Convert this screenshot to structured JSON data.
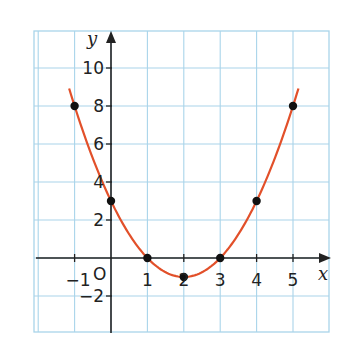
{
  "chart_data": {
    "type": "line",
    "title": "",
    "xlabel": "x",
    "ylabel": "y",
    "origin_label": "O",
    "function": "y = x^2 - 4x + 3",
    "xlim": [
      -2,
      6
    ],
    "ylim": [
      -4,
      12
    ],
    "grid": true,
    "x_ticks": [
      -1,
      1,
      2,
      3,
      4,
      5
    ],
    "x_tick_labels": [
      "−1",
      "1",
      "2",
      "3",
      "4",
      "5"
    ],
    "y_ticks": [
      10,
      8,
      6,
      4,
      2,
      -2
    ],
    "y_tick_labels": [
      "10",
      "8",
      "6",
      "4",
      "2",
      "−2"
    ],
    "points": [
      {
        "x": -1,
        "y": 8
      },
      {
        "x": 0,
        "y": 3
      },
      {
        "x": 1,
        "y": 0
      },
      {
        "x": 2,
        "y": -1
      },
      {
        "x": 3,
        "y": 0
      },
      {
        "x": 4,
        "y": 3
      },
      {
        "x": 5,
        "y": 8
      }
    ],
    "curve_domain": [
      -1.15,
      5.15
    ],
    "colors": {
      "curve": "#e2502a",
      "points": "#111111",
      "grid": "#a9d4ea",
      "axes": "#222222"
    }
  }
}
